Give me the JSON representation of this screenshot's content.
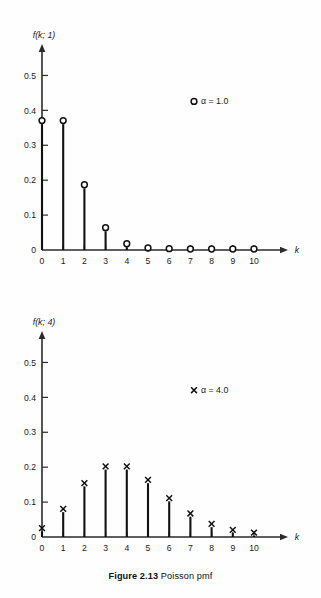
{
  "figure": {
    "caption_number": "Figure 2.13",
    "caption_text": "Poisson pmf",
    "background_color": "#fefefe",
    "ink_color": "#111111"
  },
  "chart_data": [
    {
      "type": "scatter",
      "id": "poisson-alpha-1",
      "title": "",
      "xlabel": "k",
      "ylabel": "f(k; 1)",
      "marker": "open-circle",
      "legend": "α = 1.0",
      "legend_marker": "○",
      "legend_position": "upper-right-inside",
      "grid": false,
      "xlim": [
        0,
        10
      ],
      "ylim": [
        0,
        0.55
      ],
      "xticks": [
        "0",
        "1",
        "2",
        "3",
        "4",
        "5",
        "6",
        "7",
        "8",
        "9",
        "10"
      ],
      "yticks": [
        "0",
        "0.1",
        "0.2",
        "0.3",
        "0.4",
        "0.5"
      ],
      "ytick_values": [
        0,
        0.1,
        0.2,
        0.3,
        0.4,
        0.5
      ],
      "x": [
        0,
        1,
        2,
        3,
        4,
        5,
        6,
        7,
        8,
        9,
        10
      ],
      "values": [
        0.368,
        0.368,
        0.184,
        0.061,
        0.015,
        0.003,
        0.001,
        0.0,
        0.0,
        0.0,
        0.0
      ]
    },
    {
      "type": "scatter",
      "id": "poisson-alpha-4",
      "title": "",
      "xlabel": "k",
      "ylabel": "f(k; 4)",
      "marker": "cross",
      "legend": "α = 4.0",
      "legend_marker": "×",
      "legend_position": "upper-right-inside",
      "grid": false,
      "xlim": [
        0,
        10
      ],
      "ylim": [
        0,
        0.55
      ],
      "xticks": [
        "0",
        "1",
        "2",
        "3",
        "4",
        "5",
        "6",
        "7",
        "8",
        "9",
        "10"
      ],
      "yticks": [
        "0",
        "0.1",
        "0.2",
        "0.3",
        "0.4",
        "0.5"
      ],
      "ytick_values": [
        0,
        0.1,
        0.2,
        0.3,
        0.4,
        0.5
      ],
      "x": [
        0,
        1,
        2,
        3,
        4,
        5,
        6,
        7,
        8,
        9,
        10
      ],
      "values": [
        0.018,
        0.073,
        0.147,
        0.195,
        0.195,
        0.156,
        0.104,
        0.06,
        0.03,
        0.013,
        0.005
      ]
    }
  ]
}
